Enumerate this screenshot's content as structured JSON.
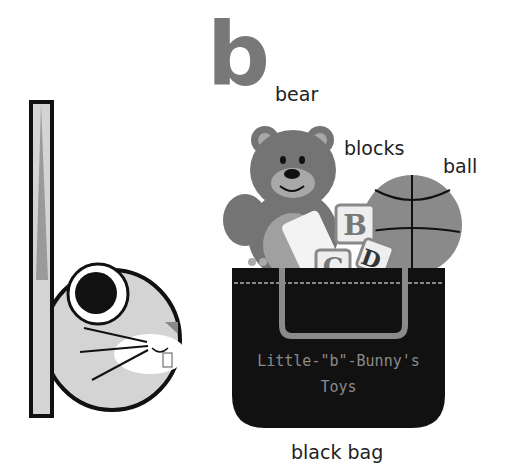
{
  "title_letter": "b",
  "labels": {
    "bear": "bear",
    "blocks": "blocks",
    "ball": "ball",
    "black_bag": "black bag"
  },
  "bag": {
    "line1": "Little-\"b\"-Bunny's",
    "line2": "Toys"
  },
  "blocks_letters": [
    "B",
    "C",
    "D"
  ],
  "colors": {
    "letter_gray": "#787878",
    "bunny_fill": "#d4d4d4",
    "bear_brown": "#747474",
    "bag_black": "#111111",
    "ball_gray": "#8a8a8a"
  }
}
